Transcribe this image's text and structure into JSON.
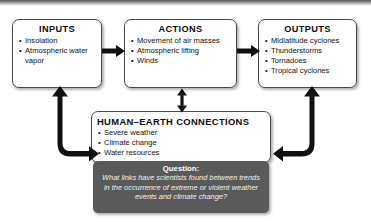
{
  "diagram": {
    "background_color": "#ffffff",
    "box_border_color": "#4a4a4a",
    "arrow_color": "#101010",
    "question_box_color": "#5a5a5a"
  },
  "boxes": {
    "inputs": {
      "title": "INPUTS",
      "items": [
        "Insolation",
        "Atmospheric water vapor"
      ]
    },
    "actions": {
      "title": "ACTIONS",
      "items": [
        "Movement of air masses",
        "Atmospheric lifting",
        "Winds"
      ]
    },
    "outputs": {
      "title": "OUTPUTS",
      "items": [
        "Midlatitude cyclones",
        "Thunderstorms",
        "Tornadoes",
        "Tropical cyclones"
      ]
    },
    "human_earth": {
      "title": "HUMAN–EARTH CONNECTIONS",
      "items": [
        "Severe weather",
        "Climate change",
        "Water resources"
      ]
    }
  },
  "question": {
    "label": "Question:",
    "text": "What links have scientists found between trends in the occurrence of extreme or violent weather events and climate change?"
  },
  "connectors": [
    {
      "name": "inputs-to-actions",
      "type": "arrow-right"
    },
    {
      "name": "actions-to-outputs",
      "type": "arrow-right"
    },
    {
      "name": "actions-human-earth",
      "type": "arrow-double-vertical"
    },
    {
      "name": "left-feedback-loop",
      "type": "elbow-left"
    },
    {
      "name": "right-feedback-loop",
      "type": "elbow-right"
    }
  ]
}
